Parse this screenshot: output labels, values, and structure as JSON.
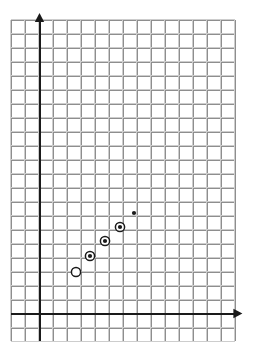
{
  "figure": {
    "kind": "coordinate-grid-scatter-plot",
    "width": 253,
    "height": 356,
    "background_color": "#ffffff",
    "title": "",
    "subtitle": ""
  },
  "grid": {
    "left_px": 11,
    "top_px": 20,
    "right_px": 235,
    "bottom_px": 341,
    "cell_px": 14,
    "columns": 16,
    "rows": 23,
    "minor_color": "#cdcdcd",
    "major_color": "#8e8e8e",
    "minor_width": 1,
    "major_width": 1.4,
    "major_every": 1,
    "visible": true,
    "border_color": "#b4b4b4"
  },
  "axes": {
    "color": "#1a1a1a",
    "width": 2,
    "origin_x_px": 39,
    "origin_y_px": 313,
    "unit_px": 14,
    "x_axis": {
      "label": "",
      "tick_labels": [],
      "start_px": 11,
      "end_px": 237,
      "y_px": 313,
      "arrow": "right",
      "arrow_size": 9
    },
    "y_axis": {
      "label": "",
      "tick_labels": [],
      "start_px": 341,
      "end_px": 22,
      "x_px": 39,
      "arrow": "up",
      "arrow_size": 9
    }
  },
  "chart_data": {
    "type": "scatter",
    "title": "",
    "xlabel": "",
    "ylabel": "",
    "xlim": [
      -2,
      14
    ],
    "ylim": [
      -2,
      21
    ],
    "grid": true,
    "legend_position": "none",
    "annotations": [],
    "tick_labels_shown": false,
    "point_count": 5,
    "x": [
      2.6,
      3.6,
      4.7,
      5.8,
      6.8
    ],
    "y": [
      2.9,
      4.1,
      5.1,
      6.1,
      7.1
    ],
    "points": [
      {
        "index": 1,
        "x": 2.6,
        "y": 2.9,
        "px": 76,
        "py": 272,
        "marker": "open-circle",
        "radius": 4.6,
        "filled": false,
        "ring": false,
        "label": ""
      },
      {
        "index": 2,
        "x": 3.6,
        "y": 4.1,
        "px": 90,
        "py": 256,
        "marker": "filled-circle-with-ring",
        "radius": 4.6,
        "filled": true,
        "ring": true,
        "label": ""
      },
      {
        "index": 3,
        "x": 4.7,
        "y": 5.1,
        "px": 105,
        "py": 241,
        "marker": "filled-circle-with-ring",
        "radius": 4.6,
        "filled": true,
        "ring": true,
        "label": ""
      },
      {
        "index": 4,
        "x": 5.8,
        "y": 6.1,
        "px": 120,
        "py": 227,
        "marker": "filled-circle-with-ring",
        "radius": 4.6,
        "filled": true,
        "ring": true,
        "label": ""
      },
      {
        "index": 5,
        "x": 6.8,
        "y": 7.1,
        "px": 134,
        "py": 213,
        "marker": "small-dot",
        "radius": 2.1,
        "filled": true,
        "ring": false,
        "label": ""
      }
    ],
    "marker_fill_color": "#1a1a1a",
    "marker_stroke_color": "#1a1a1a",
    "marker_open_fill": "#ffffff"
  }
}
